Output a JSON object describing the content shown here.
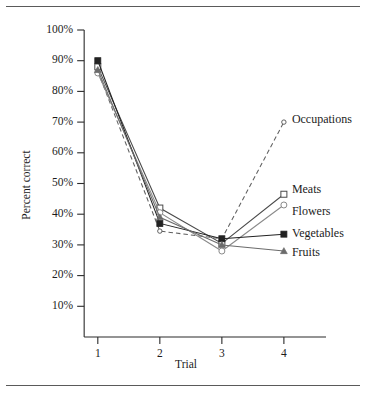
{
  "figure": {
    "background_color": "#ffffff",
    "rule_color": "#5a5a5a",
    "axis_color": "#2b2b2b"
  },
  "chart_data": {
    "type": "line",
    "title": "",
    "xlabel": "Trial",
    "ylabel": "Percent correct",
    "x": [
      1,
      2,
      3,
      4
    ],
    "categories": [
      "1",
      "2",
      "3",
      "4"
    ],
    "xtick_labels": [
      "1",
      "2",
      "3",
      "4"
    ],
    "ytick_labels": [
      "10%",
      "20%",
      "30%",
      "40%",
      "50%",
      "60%",
      "70%",
      "80%",
      "90%",
      "100%"
    ],
    "ytick_values": [
      10,
      20,
      30,
      40,
      50,
      60,
      70,
      80,
      90,
      100
    ],
    "xlim": [
      0.6,
      4.55
    ],
    "ylim": [
      0,
      100
    ],
    "grid": false,
    "legend_position": "right-inline-at-line-end",
    "series": [
      {
        "name": "Occupations",
        "values": [
          86.5,
          34.5,
          32.0,
          70.0
        ],
        "marker": "circle-open-small",
        "line_style": "dashed",
        "color": "#5f5f5f",
        "label": "Occupations"
      },
      {
        "name": "Meats",
        "values": [
          88.0,
          42.0,
          30.5,
          46.5
        ],
        "marker": "square-open",
        "line_style": "solid",
        "color": "#4a4a4a",
        "label": "Meats"
      },
      {
        "name": "Flowers",
        "values": [
          86.0,
          40.5,
          28.0,
          43.0
        ],
        "marker": "circle-open",
        "line_style": "solid",
        "color": "#8a8a8a",
        "label": "Flowers"
      },
      {
        "name": "Vegetables",
        "values": [
          90.0,
          37.0,
          32.0,
          33.5
        ],
        "marker": "square-filled",
        "line_style": "solid",
        "color": "#222222",
        "label": "Vegetables"
      },
      {
        "name": "Fruits",
        "values": [
          87.0,
          39.0,
          30.0,
          28.0
        ],
        "marker": "triangle",
        "line_style": "solid",
        "color": "#6b6b6b",
        "label": "Fruits"
      }
    ]
  }
}
